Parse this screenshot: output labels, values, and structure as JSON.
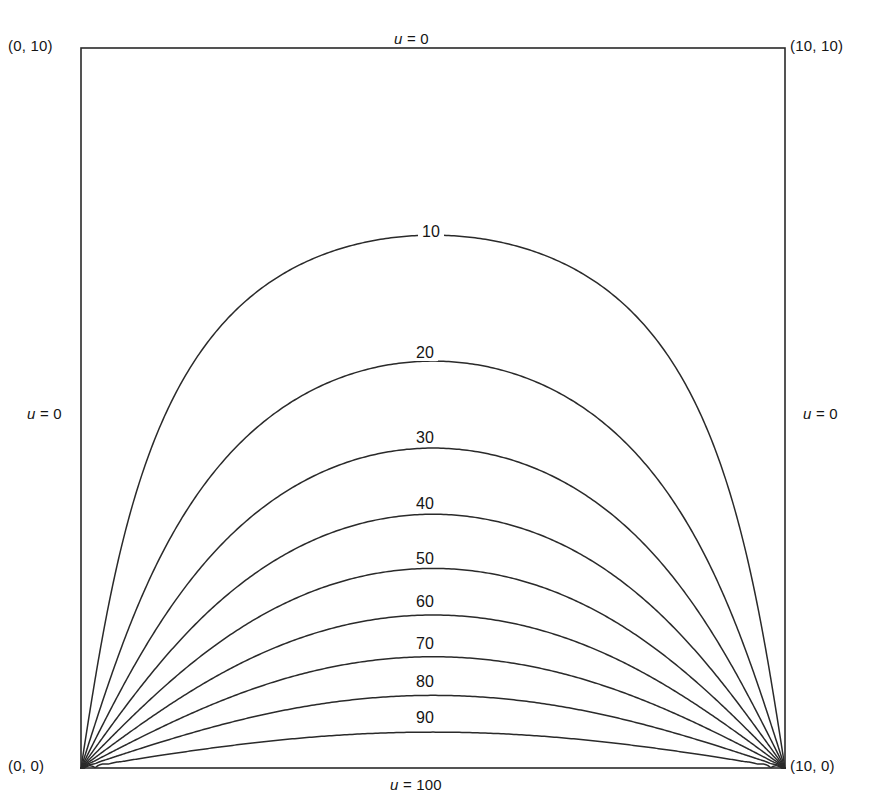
{
  "figure": {
    "kind": "contour-plot",
    "background_color": "#ffffff",
    "line_color": "#2a2a2a",
    "frame": {
      "x": 81,
      "y": 48,
      "width": 704,
      "height": 720
    }
  },
  "corners": [
    {
      "name": "bottom-left",
      "label": "(0, 0)"
    },
    {
      "name": "top-left",
      "label": "(0, 10)"
    },
    {
      "name": "bottom-right",
      "label": "(10, 0)"
    },
    {
      "name": "top-right",
      "label": "(10, 10)"
    }
  ],
  "boundary_conditions": {
    "top": {
      "variable": "u",
      "equals": "= 0"
    },
    "bottom": {
      "variable": "u",
      "equals": "= 100"
    },
    "left": {
      "variable": "u",
      "equals": "= 0"
    },
    "right": {
      "variable": "u",
      "equals": "= 0"
    }
  },
  "chart_data": {
    "type": "line",
    "title": "",
    "xlabel": "",
    "ylabel": "",
    "xlim": [
      0,
      10
    ],
    "ylim": [
      0,
      10
    ],
    "grid": false,
    "legend": "none",
    "axis_ticks": {
      "x": [],
      "y": []
    },
    "domain_corners": {
      "bottom_left": [
        0,
        0
      ],
      "top_left": [
        0,
        10
      ],
      "bottom_right": [
        10,
        0
      ],
      "top_right": [
        10,
        10
      ]
    },
    "boundary_values": {
      "top": 0,
      "left": 0,
      "right": 0,
      "bottom": 100
    },
    "contours": [
      {
        "level": 10,
        "label": "10",
        "apex_y_data": 7.33,
        "label_px": {
          "x": 418,
          "y": 224
        }
      },
      {
        "level": 20,
        "label": "20",
        "apex_y_data": 5.66,
        "label_px": {
          "x": 412,
          "y": 345
        }
      },
      {
        "level": 30,
        "label": "30",
        "apex_y_data": 4.47,
        "label_px": {
          "x": 412,
          "y": 430
        }
      },
      {
        "level": 40,
        "label": "40",
        "apex_y_data": 3.56,
        "label_px": {
          "x": 412,
          "y": 496
        }
      },
      {
        "level": 50,
        "label": "50",
        "apex_y_data": 2.85,
        "label_px": {
          "x": 412,
          "y": 551
        }
      },
      {
        "level": 60,
        "label": "60",
        "apex_y_data": 2.26,
        "label_px": {
          "x": 412,
          "y": 594
        }
      },
      {
        "level": 70,
        "label": "70",
        "apex_y_data": 1.71,
        "label_px": {
          "x": 412,
          "y": 636
        }
      },
      {
        "level": 80,
        "label": "80",
        "apex_y_data": 1.22,
        "label_px": {
          "x": 412,
          "y": 674
        }
      },
      {
        "level": 90,
        "label": "90",
        "apex_y_data": 0.76,
        "label_px": {
          "x": 412,
          "y": 710
        }
      }
    ]
  }
}
